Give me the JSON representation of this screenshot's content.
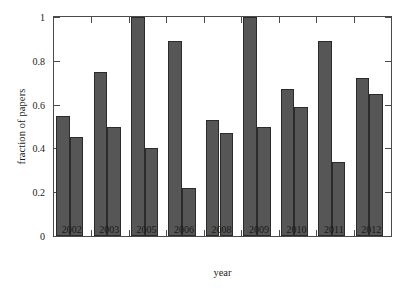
{
  "chart_data": {
    "type": "bar",
    "title": "",
    "xlabel": "year",
    "ylabel": "fraction of papers",
    "categories": [
      "2002",
      "2003",
      "2005",
      "2006",
      "2008",
      "2009",
      "2010",
      "2011",
      "2012"
    ],
    "series": [
      {
        "name": "series-1",
        "values": [
          0.55,
          0.75,
          1.0,
          0.89,
          0.53,
          1.0,
          0.67,
          0.89,
          0.72
        ]
      },
      {
        "name": "series-2",
        "values": [
          0.45,
          0.5,
          0.4,
          0.22,
          0.47,
          0.5,
          0.59,
          0.34,
          0.65
        ]
      }
    ],
    "ylim": [
      0,
      1
    ],
    "yticks": [
      0,
      0.2,
      0.4,
      0.6,
      0.8,
      1
    ],
    "ytick_labels": [
      "0",
      "0.2",
      "0.4",
      "0.6",
      "0.8",
      "1"
    ],
    "grid": false,
    "legend": "none",
    "bar_color": "#565656",
    "bar_edge_color": "#2b2b2b",
    "axis_color": "#4a4a4a",
    "background": "#ffffff"
  }
}
